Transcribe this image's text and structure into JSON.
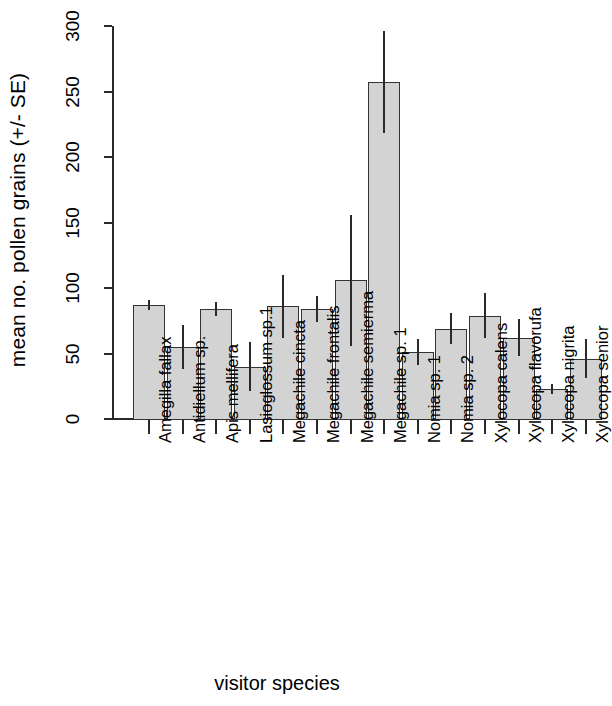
{
  "chart_data": {
    "type": "bar",
    "title": "",
    "xlabel": "visitor species",
    "ylabel": "mean no. pollen grains (+/- SE)",
    "ylim": [
      0,
      300
    ],
    "yticks": [
      0,
      50,
      100,
      150,
      200,
      250,
      300
    ],
    "grid": false,
    "legend": null,
    "error_bars": "SE",
    "bar_color": "#d3d3d3",
    "bar_border_color": "#333333",
    "categories": [
      "Amegilla fallax",
      "Antidiellum sp.",
      "Apis mellifera",
      "Lasioglossum sp.1",
      "Megachile cincta",
      "Megachile frontalis",
      "Megachile semierma",
      "Megachile sp. 1",
      "Nomia sp. 1",
      "Nomia sp. 2",
      "Xylocopa calens",
      "Xylocopa flavorufa",
      "Xylocopa nigrita",
      "Xylocopa senior"
    ],
    "values": [
      87,
      55,
      84,
      40,
      86,
      84,
      106,
      257,
      51,
      69,
      79,
      62,
      23,
      46
    ],
    "errors": [
      4,
      17,
      5,
      19,
      24,
      10,
      50,
      39,
      10,
      12,
      17,
      14,
      4,
      15
    ],
    "series": [
      {
        "name": "mean no. pollen grains",
        "values": [
          87,
          55,
          84,
          40,
          86,
          84,
          106,
          257,
          51,
          69,
          79,
          62,
          23,
          46
        ],
        "errors": [
          4,
          17,
          5,
          19,
          24,
          10,
          50,
          39,
          10,
          12,
          17,
          14,
          4,
          15
        ]
      }
    ]
  },
  "axis": {
    "y_title": "mean no. pollen grains (+/- SE)",
    "x_title": "visitor species",
    "y_tick_labels": [
      "0",
      "50",
      "100",
      "150",
      "200",
      "250",
      "300"
    ]
  }
}
